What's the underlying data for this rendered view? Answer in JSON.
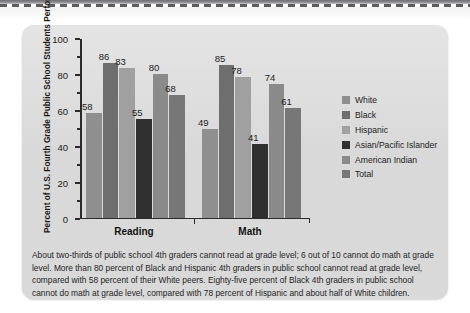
{
  "card": {
    "background_color": "#d9d9d9"
  },
  "chart_data": {
    "type": "bar",
    "title": "",
    "ylabel": "Percent of U.S. Fourth Grade Public School Students Performing Below Grade Level: 2007",
    "xlabel": "",
    "categories": [
      "Reading",
      "Math"
    ],
    "ylim": [
      0,
      100
    ],
    "yticks": [
      0,
      20,
      40,
      60,
      80,
      100
    ],
    "ytick_labels": [
      "0",
      "20",
      "40",
      "60",
      "80",
      "100"
    ],
    "minor_tick_interval": 10,
    "grid": false,
    "legend_position": "right",
    "series": [
      {
        "name": "White",
        "color": "#8f8f8f",
        "values": [
          58,
          49
        ]
      },
      {
        "name": "Black",
        "color": "#6e6e6e",
        "values": [
          86,
          85
        ]
      },
      {
        "name": "Hispanic",
        "color": "#a0a0a0",
        "values": [
          83,
          78
        ]
      },
      {
        "name": "Asian/Pacific Islander",
        "color": "#303030",
        "values": [
          55,
          41
        ]
      },
      {
        "name": "American Indian",
        "color": "#8a8a8a",
        "values": [
          80,
          74
        ]
      },
      {
        "name": "Total",
        "color": "#777777",
        "values": [
          68,
          61
        ]
      }
    ]
  },
  "caption": {
    "text": "About two-thirds of public school 4th graders cannot read at grade level; 6 out of 10 cannot do math at grade level. More than 80 percent of Black and Hispanic 4th graders in public school cannot read at grade level, compared with 58 percent of their White peers. Eighty-five percent of Black 4th graders in public school cannot do math at grade level, compared with 78 percent of Hispanic and about half of White children."
  }
}
